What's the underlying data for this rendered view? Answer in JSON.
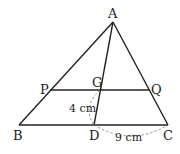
{
  "diagram": {
    "type": "geometry",
    "points": {
      "A": {
        "label": "A",
        "x": 113,
        "y": 22
      },
      "B": {
        "label": "B",
        "x": 19,
        "y": 125
      },
      "C": {
        "label": "C",
        "x": 168,
        "y": 125
      },
      "D": {
        "label": "D",
        "x": 94,
        "y": 125
      },
      "P": {
        "label": "P",
        "x": 50,
        "y": 90
      },
      "Q": {
        "label": "Q",
        "x": 149,
        "y": 90
      },
      "G": {
        "label": "G",
        "x": 100,
        "y": 90
      }
    },
    "measurements": {
      "GD": "4 cm",
      "DC": "9 cm"
    },
    "line_color": "#222222"
  }
}
